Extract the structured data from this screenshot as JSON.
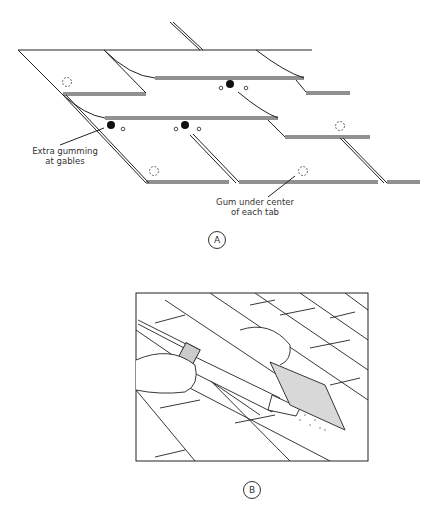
{
  "figure_a": {
    "panel_label": "A",
    "callouts": [
      {
        "id": "gables",
        "text_line1": "Extra gumming",
        "text_line2": "at gables"
      },
      {
        "id": "tab",
        "text_line1": "Gum under center",
        "text_line2": "of each tab"
      }
    ]
  },
  "figure_b": {
    "panel_label": "B"
  }
}
